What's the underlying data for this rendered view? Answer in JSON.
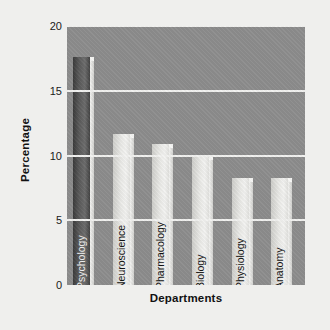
{
  "chart_data": {
    "type": "bar",
    "title": "",
    "xlabel": "Departments",
    "ylabel": "Percentage",
    "categories": [
      "Psychology",
      "Neuroscience",
      "Pharmacology",
      "Biology",
      "Physiology",
      "Anatomy"
    ],
    "values": [
      17.6,
      11.7,
      10.9,
      10.0,
      8.3,
      8.3
    ],
    "ylim": [
      0,
      20
    ],
    "yticks": [
      "0",
      "5",
      "10",
      "15",
      "20"
    ],
    "ytick_values": [
      0,
      5,
      10,
      15,
      20
    ],
    "grid": true,
    "gridline_color": "#f2f2f0",
    "legend": "none",
    "highlight_index": 0,
    "bar_colors": [
      "#4a4a4a",
      "#e6e6e3",
      "#e6e6e3",
      "#e6e6e3",
      "#e6e6e3",
      "#e6e6e3"
    ],
    "plot_background": "#8d8d8d",
    "figure_background": "#efefed"
  }
}
